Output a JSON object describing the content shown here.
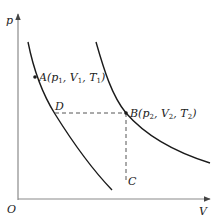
{
  "diagram": {
    "type": "p-V isotherm diagram",
    "axes": {
      "y_label": "p",
      "x_label": "V",
      "origin_label": "O"
    },
    "curves": [
      {
        "name": "isotherm-T1",
        "description": "lower isotherm through A and D, down to C"
      },
      {
        "name": "isotherm-T2",
        "description": "upper isotherm through B"
      }
    ],
    "points": {
      "A": {
        "letter": "A",
        "p": "p",
        "p_sub": "1",
        "V": "V",
        "V_sub": "1",
        "T": "T",
        "T_sub": "1"
      },
      "B": {
        "letter": "B",
        "p": "p",
        "p_sub": "2",
        "V": "V",
        "V_sub": "2",
        "T": "T",
        "T_sub": "2"
      },
      "C": {
        "letter": "C"
      },
      "D": {
        "letter": "D"
      }
    },
    "dashed_lines": [
      {
        "from": "D",
        "to": "B",
        "orientation": "horizontal"
      },
      {
        "from": "B",
        "to": "C",
        "orientation": "vertical"
      }
    ],
    "colors": {
      "axis": "#8a8a8a",
      "curve": "#1a1a1a",
      "dashed": "#555555",
      "text": "#222222"
    }
  }
}
